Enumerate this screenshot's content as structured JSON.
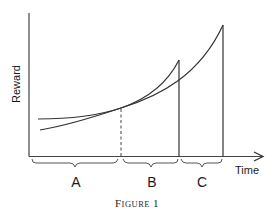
{
  "diagram": {
    "axes": {
      "y_label": "Reward",
      "x_label": "Time"
    },
    "intervals": [
      {
        "label": "A"
      },
      {
        "label": "B"
      },
      {
        "label": "C"
      }
    ],
    "curves": [
      {
        "name": "smaller-sooner-reward-curve",
        "description": "steeper curve peaking at end of interval B"
      },
      {
        "name": "larger-later-reward-curve",
        "description": "curve peaking at end of interval C"
      }
    ],
    "crossover_marker": "dashed vertical line at curve intersection (boundary between A and B)",
    "caption": {
      "prefix": "F",
      "small_caps": "IGURE",
      "number": "1"
    },
    "colors": {
      "line": "#333333",
      "text": "#1a1a1a",
      "background": "#ffffff"
    }
  }
}
